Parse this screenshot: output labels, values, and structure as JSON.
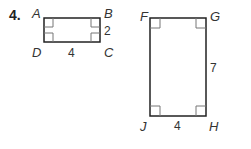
{
  "problem": {
    "number": "4.",
    "figure1": {
      "vertices": {
        "A": "A",
        "B": "B",
        "C": "C",
        "D": "D"
      },
      "side_right": "2",
      "side_bottom": "4"
    },
    "figure2": {
      "vertices": {
        "F": "F",
        "G": "G",
        "H": "H",
        "J": "J"
      },
      "side_right": "7",
      "side_bottom": "4"
    }
  }
}
